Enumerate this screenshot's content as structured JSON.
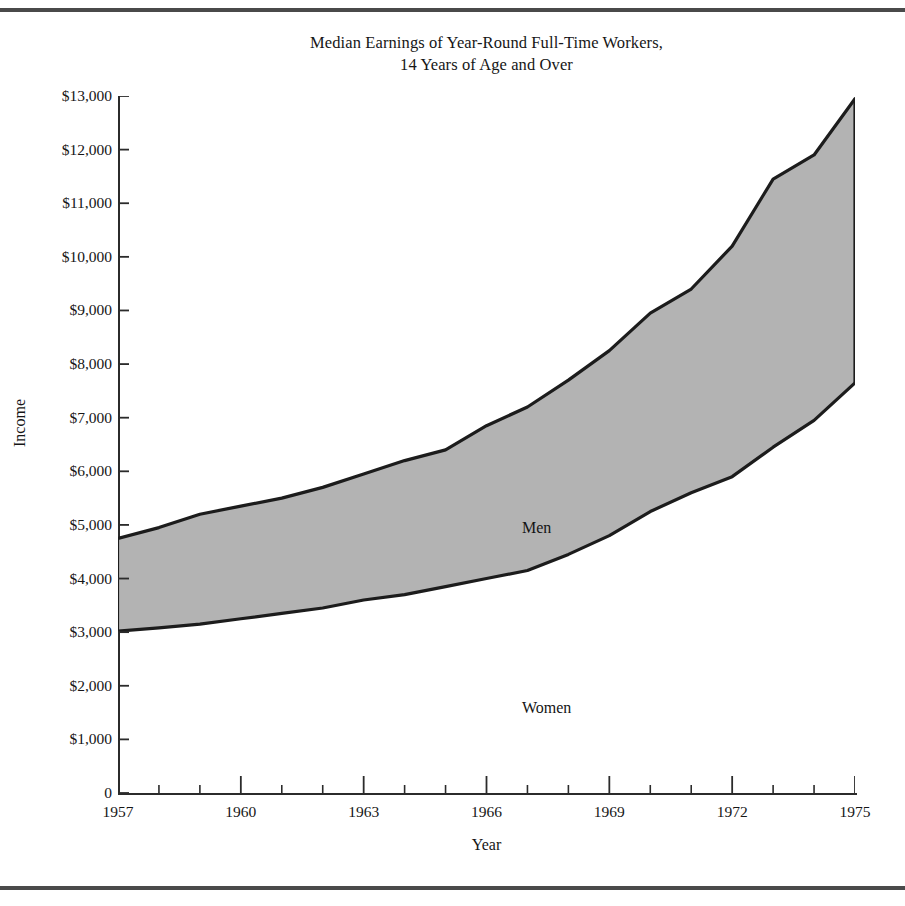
{
  "chart_data": {
    "type": "area",
    "title": "Median Earnings of Year-Round Full-Time Workers, 14 Years of Age and Over",
    "title_line1": "Median Earnings of Year-Round Full-Time Workers,",
    "title_line2": "14 Years of Age and Over",
    "xlabel": "Year",
    "ylabel": "Income",
    "xlim": [
      1957,
      1975
    ],
    "ylim": [
      0,
      13000
    ],
    "grid": false,
    "legend_position": "inline-annotation",
    "fill_between_series": true,
    "fill_color": "#b3b3b3",
    "line_color": "#1c1c1c",
    "x": [
      1957,
      1958,
      1959,
      1960,
      1961,
      1962,
      1963,
      1964,
      1965,
      1966,
      1967,
      1968,
      1969,
      1970,
      1971,
      1972,
      1973,
      1974,
      1975
    ],
    "x_tick_labels": [
      "1957",
      "1960",
      "1963",
      "1966",
      "1969",
      "1972",
      "1975"
    ],
    "x_tick_values": [
      1957,
      1960,
      1963,
      1966,
      1969,
      1972,
      1975
    ],
    "x_minor_tick_values": [
      1958,
      1959,
      1961,
      1962,
      1964,
      1965,
      1967,
      1968,
      1970,
      1971,
      1973,
      1974
    ],
    "y_tick_labels": [
      "0",
      "$1,000",
      "$2,000",
      "$3,000",
      "$4,000",
      "$5,000",
      "$6,000",
      "$7,000",
      "$8,000",
      "$9,000",
      "$10,000",
      "$11,000",
      "$12,000",
      "$13,000"
    ],
    "y_tick_values": [
      0,
      1000,
      2000,
      3000,
      4000,
      5000,
      6000,
      7000,
      8000,
      9000,
      10000,
      11000,
      12000,
      13000
    ],
    "series": [
      {
        "name": "Men",
        "label": "Men",
        "values": [
          4750,
          4950,
          5200,
          5350,
          5500,
          5700,
          5950,
          6200,
          6400,
          6850,
          7200,
          7700,
          8250,
          8950,
          9400,
          10200,
          11450,
          11900,
          12950
        ]
      },
      {
        "name": "Women",
        "label": "Women",
        "values": [
          3020,
          3080,
          3150,
          3250,
          3350,
          3450,
          3600,
          3700,
          3850,
          4000,
          4150,
          4450,
          4800,
          5250,
          5600,
          5900,
          6450,
          6950,
          7650
        ]
      }
    ]
  }
}
